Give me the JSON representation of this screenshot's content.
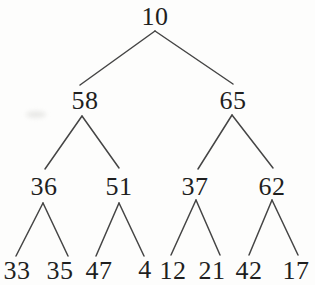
{
  "diagram": {
    "type": "binary-tree",
    "nodes": [
      {
        "id": "10",
        "label": "10",
        "level": 0
      },
      {
        "id": "58",
        "label": "58",
        "level": 1
      },
      {
        "id": "65",
        "label": "65",
        "level": 1
      },
      {
        "id": "36",
        "label": "36",
        "level": 2
      },
      {
        "id": "51",
        "label": "51",
        "level": 2
      },
      {
        "id": "37",
        "label": "37",
        "level": 2
      },
      {
        "id": "62",
        "label": "62",
        "level": 2
      },
      {
        "id": "33",
        "label": "33",
        "level": 3
      },
      {
        "id": "35",
        "label": "35",
        "level": 3
      },
      {
        "id": "47",
        "label": "47",
        "level": 3
      },
      {
        "id": "4",
        "label": "4",
        "level": 3
      },
      {
        "id": "12",
        "label": "12",
        "level": 3
      },
      {
        "id": "21",
        "label": "21",
        "level": 3
      },
      {
        "id": "42",
        "label": "42",
        "level": 3
      },
      {
        "id": "17",
        "label": "17",
        "level": 3
      }
    ],
    "edges": [
      [
        "10",
        "58"
      ],
      [
        "10",
        "65"
      ],
      [
        "58",
        "36"
      ],
      [
        "58",
        "51"
      ],
      [
        "65",
        "37"
      ],
      [
        "65",
        "62"
      ],
      [
        "36",
        "33"
      ],
      [
        "36",
        "35"
      ],
      [
        "51",
        "47"
      ],
      [
        "51",
        "4"
      ],
      [
        "37",
        "12"
      ],
      [
        "37",
        "21"
      ],
      [
        "62",
        "42"
      ],
      [
        "62",
        "17"
      ]
    ],
    "colors": {
      "text": "#1f1f1f",
      "line": "#454545",
      "background": "#fdfdfc"
    }
  }
}
